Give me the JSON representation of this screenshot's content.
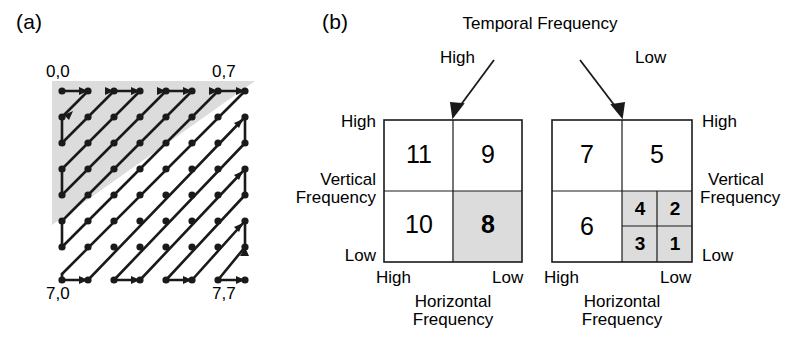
{
  "figure": {
    "panel_a_label": "(a)",
    "panel_b_label": "(b)"
  },
  "panel_a": {
    "description": "8x8 coefficient grid traversed by a zigzag scan path",
    "grid_size": 8,
    "corner_labels": {
      "top_left": "0,0",
      "top_right": "0,7",
      "bottom_left": "7,0",
      "bottom_right": "7,7"
    },
    "shaded_region": "upper-left triangle",
    "shade_color": "#dcdcdc",
    "line_color": "#1a1a1a",
    "dot_color": "#1a1a1a"
  },
  "panel_b": {
    "top_axis_title": "Temporal Frequency",
    "left_box": {
      "temporal_label": "High",
      "vertical_axis_title_line1": "Vertical",
      "vertical_axis_title_line2": "Frequency",
      "vertical_high": "High",
      "vertical_low": "Low",
      "horizontal_high": "High",
      "horizontal_low": "Low",
      "horizontal_axis_title_line1": "Horizontal",
      "horizontal_axis_title_line2": "Frequency",
      "quadrants": [
        {
          "label": "11",
          "position": "top-left",
          "shaded": false
        },
        {
          "label": "9",
          "position": "top-right",
          "shaded": false
        },
        {
          "label": "10",
          "position": "bottom-left",
          "shaded": false
        },
        {
          "label": "8",
          "position": "bottom-right",
          "shaded": true
        }
      ]
    },
    "right_box": {
      "temporal_label": "Low",
      "vertical_axis_title_line1": "Vertical",
      "vertical_axis_title_line2": "Frequency",
      "vertical_high": "High",
      "vertical_low": "Low",
      "horizontal_high": "High",
      "horizontal_low": "Low",
      "horizontal_axis_title_line1": "Horizontal",
      "horizontal_axis_title_line2": "Frequency",
      "quadrants": [
        {
          "label": "7",
          "position": "top-left",
          "shaded": false
        },
        {
          "label": "5",
          "position": "top-right",
          "shaded": false
        },
        {
          "label": "6",
          "position": "bottom-left",
          "shaded": false
        }
      ],
      "sub_quadrants": [
        {
          "label": "4",
          "position": "top-left",
          "shaded": true
        },
        {
          "label": "2",
          "position": "top-right",
          "shaded": true
        },
        {
          "label": "3",
          "position": "bottom-left",
          "shaded": true
        },
        {
          "label": "1",
          "position": "bottom-right",
          "shaded": true
        }
      ]
    },
    "shade_color": "#dcdcdc"
  }
}
